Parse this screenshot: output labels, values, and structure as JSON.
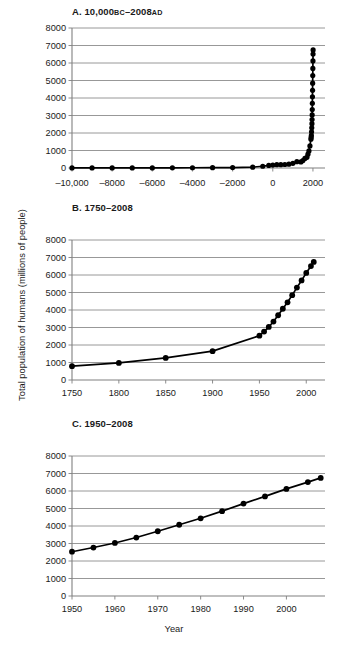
{
  "figure": {
    "ylabel": "Total population of humans (millions of people)",
    "xlabel": "Year",
    "caption_fragment": "",
    "line_color": "#000000",
    "marker_color": "#000000",
    "grid_color": "#8c8c8c",
    "axis_color": "#808080",
    "background": "#ffffff"
  },
  "chart_data": [
    {
      "id": "A",
      "type": "line",
      "title": "A. 10,000BC–2008AD",
      "title_main": "A. 10,000",
      "title_era1": "BC",
      "title_dash": "–2008",
      "title_era2": "AD",
      "xlabel": "",
      "ylabel": "Total population of humans (millions of people)",
      "xlim": [
        -10000,
        2600
      ],
      "ylim": [
        0,
        8000
      ],
      "xticks": [
        -10000,
        -8000,
        -6000,
        -4000,
        -2000,
        0,
        2000
      ],
      "xticklabels": [
        "–10,000",
        "–8000",
        "–6000",
        "–4000",
        "–2000",
        "0",
        "2000"
      ],
      "yticks": [
        0,
        1000,
        2000,
        3000,
        4000,
        5000,
        6000,
        7000,
        8000
      ],
      "yticklabels": [
        "0",
        "1000",
        "2000",
        "3000",
        "4000",
        "5000",
        "6000",
        "7000",
        "8000"
      ],
      "grid": "horizontal",
      "legend": "none",
      "x": [
        -10000,
        -9000,
        -8000,
        -7000,
        -6000,
        -5000,
        -4000,
        -3000,
        -2000,
        -1000,
        -500,
        -200,
        1,
        200,
        400,
        600,
        800,
        1000,
        1200,
        1400,
        1500,
        1600,
        1700,
        1750,
        1800,
        1850,
        1900,
        1910,
        1920,
        1930,
        1940,
        1950,
        1955,
        1960,
        1965,
        1970,
        1975,
        1980,
        1985,
        1990,
        1995,
        2000,
        2005,
        2008
      ],
      "y": [
        4,
        5,
        5,
        6,
        7,
        10,
        14,
        20,
        27,
        50,
        100,
        150,
        170,
        190,
        190,
        200,
        220,
        265,
        360,
        350,
        425,
        545,
        610,
        791,
        978,
        1262,
        1650,
        1750,
        1860,
        2070,
        2300,
        2530,
        2770,
        3030,
        3340,
        3700,
        4070,
        4440,
        4850,
        5280,
        5690,
        6120,
        6510,
        6750
      ]
    },
    {
      "id": "B",
      "type": "line",
      "title": "B. 1750–2008",
      "xlabel": "",
      "ylabel": "Total population of humans (millions of people)",
      "xlim": [
        1750,
        2020
      ],
      "ylim": [
        0,
        8000
      ],
      "xticks": [
        1750,
        1800,
        1850,
        1900,
        1950,
        2000
      ],
      "xticklabels": [
        "1750",
        "1800",
        "1850",
        "1900",
        "1950",
        "2000"
      ],
      "yticks": [
        0,
        1000,
        2000,
        3000,
        4000,
        5000,
        6000,
        7000,
        8000
      ],
      "yticklabels": [
        "0",
        "1000",
        "2000",
        "3000",
        "4000",
        "5000",
        "6000",
        "7000",
        "8000"
      ],
      "grid": "horizontal",
      "legend": "none",
      "x": [
        1750,
        1800,
        1850,
        1900,
        1950,
        1955,
        1960,
        1965,
        1970,
        1975,
        1980,
        1985,
        1990,
        1995,
        2000,
        2005,
        2008
      ],
      "y": [
        791,
        978,
        1262,
        1650,
        2530,
        2770,
        3030,
        3340,
        3700,
        4070,
        4440,
        4850,
        5280,
        5690,
        6120,
        6510,
        6750
      ]
    },
    {
      "id": "C",
      "type": "line",
      "title": "C. 1950–2008",
      "xlabel": "Year",
      "ylabel": "Total population of humans (millions of people)",
      "xlim": [
        1950,
        2009
      ],
      "ylim": [
        0,
        8000
      ],
      "xticks": [
        1950,
        1960,
        1970,
        1980,
        1990,
        2000
      ],
      "xticklabels": [
        "1950",
        "1960",
        "1970",
        "1980",
        "1990",
        "2000"
      ],
      "yticks": [
        0,
        1000,
        2000,
        3000,
        4000,
        5000,
        6000,
        7000,
        8000
      ],
      "yticklabels": [
        "0",
        "1000",
        "2000",
        "3000",
        "4000",
        "5000",
        "6000",
        "7000",
        "8000"
      ],
      "grid": "horizontal",
      "legend": "none",
      "x": [
        1950,
        1955,
        1960,
        1965,
        1970,
        1975,
        1980,
        1985,
        1990,
        1995,
        2000,
        2005,
        2008
      ],
      "y": [
        2530,
        2770,
        3030,
        3340,
        3700,
        4070,
        4440,
        4850,
        5280,
        5690,
        6120,
        6510,
        6750
      ]
    }
  ]
}
